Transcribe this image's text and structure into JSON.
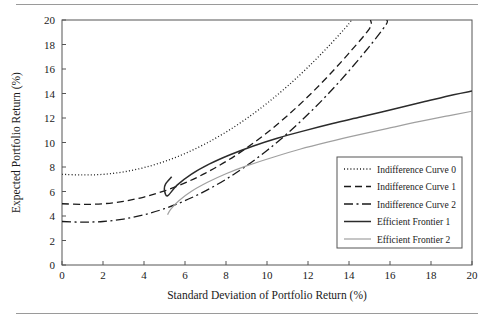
{
  "figure": {
    "background_color": "#ffffff",
    "frame_color": "#555555",
    "rule_color": "#9a9a9a"
  },
  "chart_data": {
    "type": "line",
    "title": "",
    "xlabel": "Standard Deviation of Portfolio Return (%)",
    "ylabel": "Expected Portfolio Return (%)",
    "xlim": [
      0,
      20
    ],
    "ylim": [
      0,
      20
    ],
    "xticks": [
      0,
      2,
      4,
      6,
      8,
      10,
      12,
      14,
      16,
      18,
      20
    ],
    "yticks": [
      0,
      2,
      4,
      6,
      8,
      10,
      12,
      14,
      16,
      18,
      20
    ],
    "xtick_labels": [
      "0",
      "2",
      "4",
      "6",
      "8",
      "10",
      "12",
      "14",
      "16",
      "18",
      "20"
    ],
    "ytick_labels": [
      "0",
      "2",
      "4",
      "6",
      "8",
      "10",
      "12",
      "14",
      "16",
      "18",
      "20"
    ],
    "grid": false,
    "legend_position": "lower right",
    "series": [
      {
        "name": "Indifference Curve 0",
        "style": "dotted",
        "color": "#1a1a1a",
        "width": 1.3,
        "dash": "1,2.2",
        "x": [
          0,
          1,
          2,
          3,
          4,
          5,
          6,
          7,
          8,
          9,
          10,
          11,
          12,
          13,
          14,
          14.05
        ],
        "y": [
          7.4,
          7.35,
          7.4,
          7.6,
          7.95,
          8.45,
          9.1,
          9.9,
          10.85,
          11.95,
          13.2,
          14.6,
          16.15,
          17.85,
          19.7,
          20.0
        ]
      },
      {
        "name": "Indifference Curve 1",
        "style": "dashed",
        "color": "#1a1a1a",
        "width": 1.3,
        "dash": "7,4",
        "x": [
          0,
          1,
          2,
          3,
          4,
          5,
          6,
          7,
          8,
          9,
          10,
          11,
          12,
          13,
          14,
          15,
          15.05
        ],
        "y": [
          5.0,
          4.95,
          5.0,
          5.2,
          5.55,
          6.05,
          6.7,
          7.5,
          8.45,
          9.55,
          10.8,
          12.2,
          13.75,
          15.45,
          17.3,
          19.3,
          20.0
        ]
      },
      {
        "name": "Indifference Curve 2",
        "style": "dashdot",
        "color": "#1a1a1a",
        "width": 1.3,
        "dash": "9,3.5,2,3.5",
        "x": [
          0,
          1,
          2,
          3,
          4,
          5,
          6,
          7,
          8,
          9,
          10,
          11,
          12,
          13,
          14,
          15,
          15.8,
          15.85
        ],
        "y": [
          3.55,
          3.5,
          3.55,
          3.75,
          4.1,
          4.6,
          5.25,
          6.05,
          7.0,
          8.1,
          9.35,
          10.75,
          12.3,
          14.0,
          15.85,
          17.85,
          19.6,
          20.0
        ]
      },
      {
        "name": "Efficient Frontier 1",
        "style": "solid",
        "color": "#2b2b2b",
        "width": 1.5,
        "dash": "",
        "x": [
          5.35,
          5.05,
          5.0,
          5.15,
          5.6,
          6.3,
          7.2,
          8.2,
          9.3,
          10.5,
          11.8,
          13.2,
          14.6,
          16.1,
          17.6,
          19.1,
          20.0
        ],
        "y": [
          7.2,
          6.6,
          6.1,
          5.65,
          6.5,
          7.4,
          8.25,
          9.0,
          9.7,
          10.35,
          10.95,
          11.55,
          12.1,
          12.7,
          13.3,
          13.9,
          14.2
        ]
      },
      {
        "name": "Efficient Frontier 2",
        "style": "solid-light",
        "color": "#a0a0a0",
        "width": 1.2,
        "dash": "",
        "x": [
          5.15,
          5.3,
          5.7,
          6.3,
          7.1,
          8.0,
          9.1,
          10.3,
          11.6,
          13.0,
          14.4,
          15.9,
          17.4,
          18.9,
          20.0
        ],
        "y": [
          4.1,
          4.55,
          5.25,
          6.0,
          6.75,
          7.45,
          8.15,
          8.8,
          9.45,
          10.05,
          10.6,
          11.15,
          11.7,
          12.2,
          12.55
        ]
      }
    ]
  },
  "legend": {
    "entries": [
      {
        "label": "Indifference Curve 0",
        "style": "dotted"
      },
      {
        "label": "Indifference Curve 1",
        "style": "dashed"
      },
      {
        "label": "Indifference Curve 2",
        "style": "dashdot"
      },
      {
        "label": "Efficient Frontier 1",
        "style": "solid"
      },
      {
        "label": "Efficient Frontier 2",
        "style": "solid-light"
      }
    ]
  }
}
